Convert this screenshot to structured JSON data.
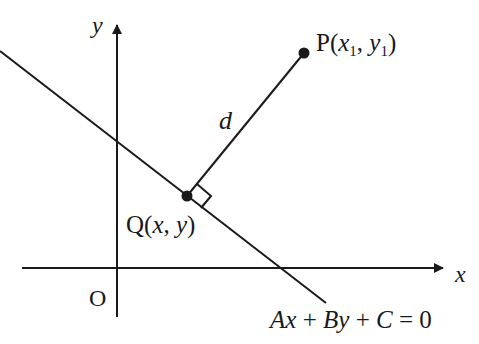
{
  "diagram": {
    "type": "point-to-line-distance",
    "colors": {
      "stroke": "#1a1a1a",
      "background": "#ffffff"
    },
    "axes": {
      "x_label": "x",
      "y_label": "y",
      "origin_label": "O"
    },
    "line": {
      "equation": "Ax + By + C = 0",
      "equation_parts": {
        "A": "A",
        "x1": "x",
        "plus1": " + ",
        "B": "B",
        "y1": "y",
        "plus2": " + ",
        "C": "C",
        "eq": " = 0"
      }
    },
    "point_P": {
      "name": "P",
      "open": "(",
      "x": "x",
      "sub_x": "1",
      "comma": ", ",
      "y": "y",
      "sub_y": "1",
      "close": ")"
    },
    "point_Q": {
      "name": "Q",
      "open": "(",
      "x": "x",
      "comma": ", ",
      "y": "y",
      "close": ")"
    },
    "distance_label": "d"
  }
}
